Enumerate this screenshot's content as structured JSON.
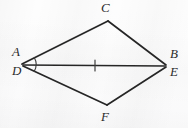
{
  "figure": {
    "kind": "geometry-diagram",
    "canvas": {
      "width": 188,
      "height": 128
    },
    "background_color": "#fbfbfb",
    "stroke_color": "#262626",
    "label_color": "#2b2b2b",
    "vertices": [
      {
        "name": "A",
        "label": "A",
        "x": 22,
        "y": 64,
        "label_x": 12,
        "label_y": 49
      },
      {
        "name": "D",
        "label": "D",
        "x": 22,
        "y": 64,
        "label_x": 12,
        "label_y": 65
      },
      {
        "name": "C",
        "label": "C",
        "x": 108,
        "y": 21,
        "label_x": 101,
        "label_y": 2
      },
      {
        "name": "B",
        "label": "B",
        "x": 165,
        "y": 66,
        "label_x": 170,
        "label_y": 50
      },
      {
        "name": "E",
        "label": "E",
        "x": 165,
        "y": 66,
        "label_x": 170,
        "label_y": 66
      },
      {
        "name": "F",
        "label": "F",
        "x": 107,
        "y": 105,
        "label_x": 101,
        "label_y": 110
      }
    ],
    "segments": [
      {
        "name": "segment-AC",
        "from": "A",
        "to": "C",
        "x1": 22,
        "y1": 64,
        "x2": 108,
        "y2": 21
      },
      {
        "name": "segment-CB",
        "from": "C",
        "to": "B",
        "x1": 108,
        "y1": 21,
        "x2": 166,
        "y2": 65
      },
      {
        "name": "segment-DE",
        "from": "D",
        "to": "E",
        "x1": 23,
        "y1": 65,
        "x2": 165,
        "y2": 66
      },
      {
        "name": "segment-DF",
        "from": "D",
        "to": "F",
        "x1": 23,
        "y1": 66,
        "x2": 107,
        "y2": 105
      },
      {
        "name": "segment-FE",
        "from": "F",
        "to": "E",
        "x1": 107,
        "y1": 105,
        "x2": 166,
        "y2": 67
      }
    ],
    "marks": {
      "angle_arc": {
        "name": "angle-arc-at-AD",
        "at_vertex": "A/D",
        "center_x": 22,
        "center_y": 64,
        "radius": 14,
        "path": "M 34.1 57.2 A 14 14 0 0 1 34.1 71.6"
      },
      "congruence_tick": {
        "name": "congruence-tick-on-DE",
        "on_segment": "segment-DE",
        "x": 95,
        "y_top": 60,
        "y_bottom": 71,
        "count": 1
      }
    }
  }
}
